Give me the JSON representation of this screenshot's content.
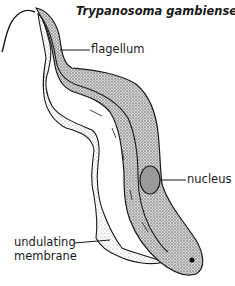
{
  "diagram": {
    "title": "Trypanosoma gambiense",
    "labels": {
      "flagellum": "flagellum",
      "nucleus": "nucleus",
      "undulating_line1": "undulating",
      "undulating_line2": "membrane"
    },
    "colors": {
      "ink": "#1a1a1a",
      "background": "#ffffff",
      "stipple": "#8a8a8a"
    }
  }
}
